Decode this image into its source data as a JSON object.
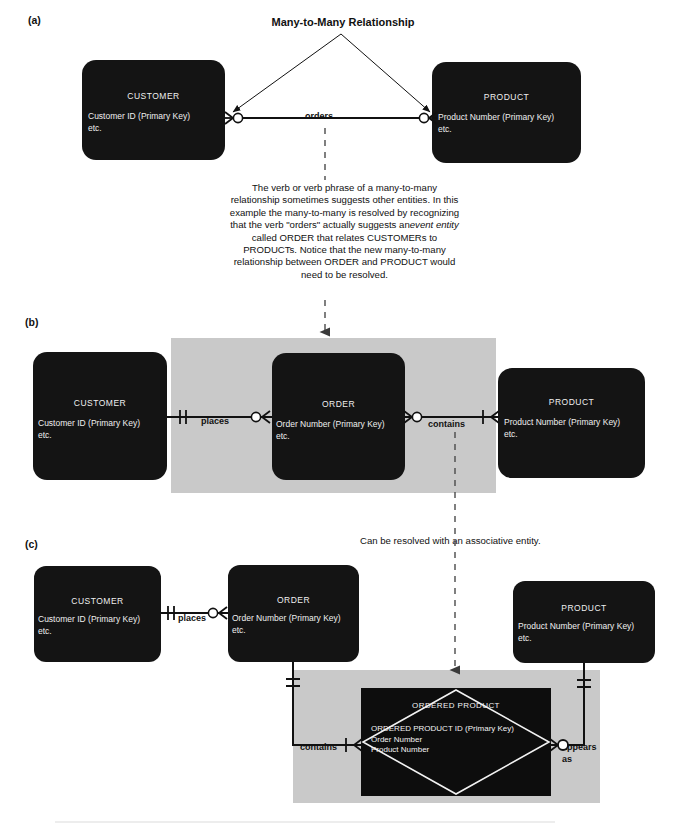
{
  "figure": {
    "title": "Many-to-Many Relationship",
    "panels": [
      {
        "label": "(a)"
      },
      {
        "label": "(b)"
      },
      {
        "label": "(c)"
      }
    ]
  },
  "panel_a": {
    "label": "(a)",
    "title": "Many-to-Many Relationship",
    "entities": [
      {
        "name": "CUSTOMER",
        "attr1": "Customer ID (Primary Key)",
        "attr2": "etc."
      },
      {
        "name": "PRODUCT",
        "attr1": "Product Number  (Primary Key)",
        "attr2": "etc."
      }
    ],
    "relationship": "orders"
  },
  "note": {
    "line1": "The verb or verb phrase of a many-to-many",
    "line2": "relationship sometimes suggests other entities. In this",
    "line3": "example the many-to-many is resolved by recognizing",
    "line4_pre": "that the verb \"orders\" actually suggests an",
    "line4_em": "event entity",
    "line5": "called ORDER that relates CUSTOMERs to",
    "line6": "PRODUCTs. Notice that the new many-to-many",
    "line7": "relationship between ORDER and PRODUCT would",
    "line8": "need to be resolved."
  },
  "panel_b": {
    "label": "(b)",
    "entities": [
      {
        "name": "CUSTOMER",
        "attr1": "Customer ID (Primary Key)",
        "attr2": "etc."
      },
      {
        "name": "ORDER",
        "attr1": "Order Number (Primary Key)",
        "attr2": "etc."
      },
      {
        "name": "PRODUCT",
        "attr1": "Product Number (Primary Key)",
        "attr2": "etc."
      }
    ],
    "relationships": [
      "places",
      "contains"
    ]
  },
  "panel_c": {
    "label": "(c)",
    "caption": "Can be resolved with an associative entity.",
    "entities": [
      {
        "name": "CUSTOMER",
        "attr1": "Customer ID (Primary Key)",
        "attr2": "etc."
      },
      {
        "name": "ORDER",
        "attr1": "Order Number (Primary Key)",
        "attr2": "etc."
      },
      {
        "name": "PRODUCT",
        "attr1": "Product Number (Primary Key)",
        "attr2": "etc."
      }
    ],
    "associative_entity": {
      "name": "ORDERED PRODUCT",
      "attr1": "ORDERED PRODUCT ID (Primary Key)",
      "attr2": "Order Number",
      "attr3": "Product Number"
    },
    "relationships": [
      "places",
      "contains",
      "appears",
      "as"
    ]
  },
  "colors": {
    "entity_fill": "#141414",
    "band_fill": "#c9c9c9",
    "entity_text": "#efefef",
    "line": "#111111",
    "page_background": "#ffffff"
  }
}
